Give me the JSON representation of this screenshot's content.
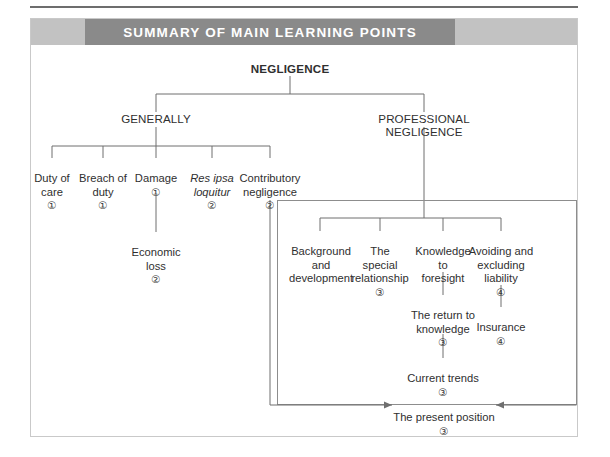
{
  "header": {
    "title": "SUMMARY OF MAIN LEARNING POINTS"
  },
  "diagram": {
    "root": {
      "label": "NEGLIGENCE"
    },
    "branches": [
      {
        "label": "GENERALLY"
      },
      {
        "label": "PROFESSIONAL NEGLIGENCE"
      }
    ],
    "generally_children": [
      {
        "label": "Duty of\ncare",
        "number": "①"
      },
      {
        "label": "Breach of\nduty",
        "number": "①"
      },
      {
        "label": "Damage",
        "number": "①"
      },
      {
        "label": "Res ipsa\nloquitur",
        "number": "②",
        "italic": true
      },
      {
        "label": "Contributory\nnegligence",
        "number": "②"
      }
    ],
    "damage_child": {
      "label": "Economic\nloss",
      "number": "②"
    },
    "professional_children": [
      {
        "label": "Background\nand\ndevelopment",
        "number": ""
      },
      {
        "label": "The\nspecial\nrelationship",
        "number": "③"
      },
      {
        "label": "Knowledge\nto\nforesight",
        "number": ""
      },
      {
        "label": "Avoiding and\nexcluding\nliability",
        "number": "④"
      }
    ],
    "knowledge_chain": [
      {
        "label": "The return to\nknowledge",
        "number": "③"
      },
      {
        "label": "Current trends",
        "number": "③"
      }
    ],
    "avoiding_chain": [
      {
        "label": "Insurance",
        "number": "④"
      }
    ],
    "conclusion": {
      "label": "The present position",
      "number": "③"
    }
  }
}
